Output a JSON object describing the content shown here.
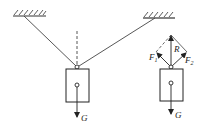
{
  "diagram": {
    "type": "physics-force-diagram",
    "left_figure": {
      "description": "Object hung by two ropes from two ceilings, with dashed vertical line above knot",
      "weight_label": "G"
    },
    "right_figure": {
      "description": "Force parallelogram: rope tensions F1 and F2 combine into resultant R balancing weight G",
      "labels": {
        "F1": "F",
        "F1_sub": "1",
        "F2": "F",
        "F2_sub": "2",
        "R": "R",
        "G": "G"
      }
    },
    "colors": {
      "line": "#333333",
      "background": "#ffffff"
    }
  }
}
